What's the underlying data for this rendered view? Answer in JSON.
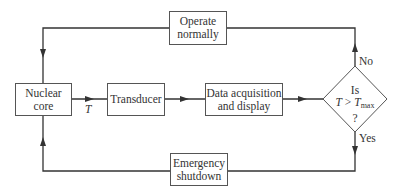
{
  "diagram": {
    "type": "flowchart",
    "nodes": {
      "nuclear_core": {
        "line1": "Nuclear",
        "line2": "core"
      },
      "transducer": {
        "label": "Transducer"
      },
      "data_acquisition": {
        "line1": "Data acquisition",
        "line2": "and display"
      },
      "decision": {
        "line1": "Is",
        "var": "T",
        "op": " > ",
        "var2": "T",
        "sub": "max",
        "line3": "?"
      },
      "operate_normally": {
        "line1": "Operate",
        "line2": "normally"
      },
      "emergency_shutdown": {
        "line1": "Emergency",
        "line2": "shutdown"
      }
    },
    "edge_labels": {
      "signal": "T",
      "no": "No",
      "yes": "Yes"
    },
    "edges": [
      {
        "from": "Nuclear core",
        "to": "Transducer",
        "label": "T"
      },
      {
        "from": "Transducer",
        "to": "Data acquisition and display"
      },
      {
        "from": "Data acquisition and display",
        "to": "Is T > Tmax ?"
      },
      {
        "from": "Is T > Tmax ?",
        "to": "Operate normally",
        "label": "No"
      },
      {
        "from": "Operate normally",
        "to": "Nuclear core"
      },
      {
        "from": "Is T > Tmax ?",
        "to": "Emergency shutdown",
        "label": "Yes"
      },
      {
        "from": "Emergency shutdown",
        "to": "Nuclear core"
      }
    ],
    "colors": {
      "line": "#333333",
      "border": "#555555",
      "text": "#333333"
    }
  }
}
